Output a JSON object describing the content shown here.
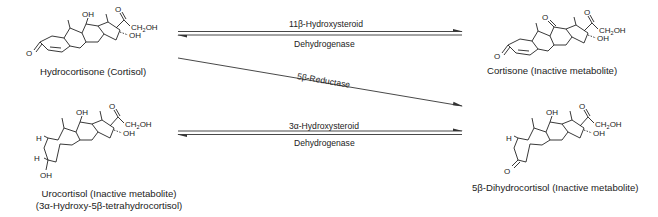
{
  "compounds": {
    "cortisol": {
      "name": "Hydrocortisone (Cortisol)",
      "c11": "OH",
      "c3": "O",
      "side_carbonyl": "O",
      "side_chain": "CH2OH",
      "c17": "OH"
    },
    "cortisone": {
      "name": "Cortisone (Inactive metabolite)",
      "c11": "O",
      "c3": "O",
      "side_carbonyl": "O",
      "side_chain": "CH2OH",
      "c17": "OH"
    },
    "urocortisol": {
      "name_line1": "Urocortisol (Inactive metabolite)",
      "name_line2": "(3α-Hydroxy-5β-tetrahydrocortisol)",
      "c11": "OH",
      "c3": "OH",
      "h5": "H",
      "h3": "H",
      "side_carbonyl": "O",
      "side_chain": "CH2OH",
      "c17": "OH"
    },
    "dihydrocortisol": {
      "name": "5β-Dihydrocortisol (Inactive metabolite)",
      "c11": "OH",
      "c3": "O",
      "h5": "H",
      "side_carbonyl": "O",
      "side_chain": "CH2OH",
      "c17": "OH"
    }
  },
  "reactions": {
    "top": {
      "enzyme_line1": "11β-Hydroxysteroid",
      "enzyme_line2": "Dehydrogenase",
      "type": "reversible"
    },
    "diagonal": {
      "enzyme": "5β-Reductase",
      "type": "forward"
    },
    "bottom": {
      "enzyme_line1": "3α-Hydroxysteroid",
      "enzyme_line2": "Dehydrogenase",
      "type": "reversible"
    }
  }
}
